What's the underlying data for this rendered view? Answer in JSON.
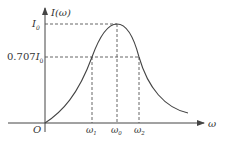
{
  "diagram": {
    "type": "resonance-curve",
    "y_axis_label": "I(ω)",
    "x_axis_label": "ω",
    "origin_label": "O",
    "y_levels": [
      {
        "label_main": "I",
        "label_sub": "0",
        "prefix": "",
        "meaning": "peak current"
      },
      {
        "label_main": "I",
        "label_sub": "0",
        "prefix": "0.707",
        "meaning": "half-power current"
      }
    ],
    "x_marks": [
      {
        "main": "ω",
        "sub": "1"
      },
      {
        "main": "ω",
        "sub": "0"
      },
      {
        "main": "ω",
        "sub": "2"
      }
    ],
    "colors": {
      "line": "#444444",
      "dash": "#555555"
    }
  }
}
